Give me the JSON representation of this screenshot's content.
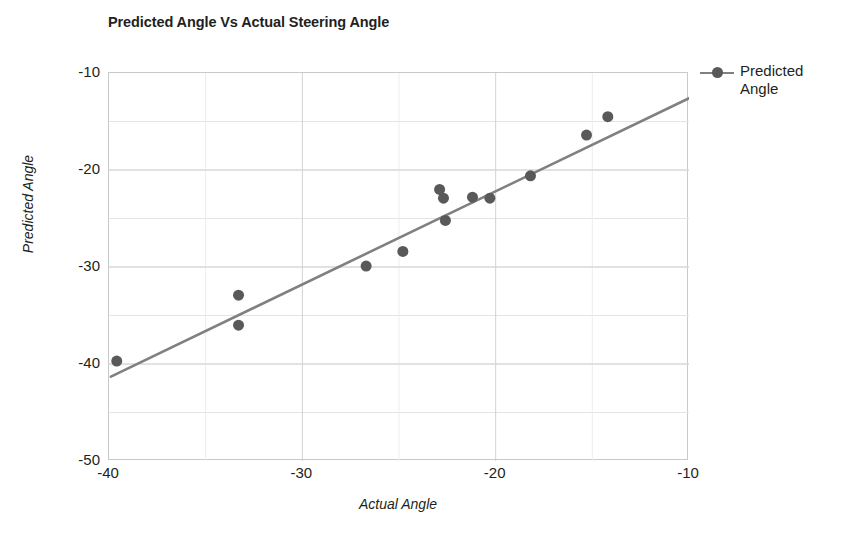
{
  "chart_data": {
    "type": "scatter",
    "title": "Predicted Angle Vs Actual Steering Angle",
    "xlabel": "Actual Angle",
    "ylabel": "Predicted Angle",
    "xlim": [
      -40,
      -10
    ],
    "ylim": [
      -50,
      -10
    ],
    "xticks": [
      "-40",
      "-30",
      "-20",
      "-10"
    ],
    "xtick_values": [
      -40,
      -30,
      -20,
      -10
    ],
    "yticks": [
      "-10",
      "-20",
      "-30",
      "-40",
      "-50"
    ],
    "ytick_values": [
      -10,
      -20,
      -30,
      -40,
      -50
    ],
    "grid": true,
    "grid_minor_step": 5,
    "grid_color": "#d9d9d9",
    "legend_position": "right",
    "series": [
      {
        "name": "Predicted Angle",
        "marker_color": "#595959",
        "line_color": "#808080",
        "marker_size": 11,
        "points": [
          {
            "x": -39.6,
            "y": -39.7
          },
          {
            "x": -33.3,
            "y": -32.9
          },
          {
            "x": -33.3,
            "y": -36.0
          },
          {
            "x": -26.7,
            "y": -29.9
          },
          {
            "x": -24.8,
            "y": -28.4
          },
          {
            "x": -22.9,
            "y": -22.0
          },
          {
            "x": -22.7,
            "y": -22.9
          },
          {
            "x": -22.6,
            "y": -25.2
          },
          {
            "x": -21.2,
            "y": -22.8
          },
          {
            "x": -20.3,
            "y": -22.9
          },
          {
            "x": -18.2,
            "y": -20.6
          },
          {
            "x": -15.3,
            "y": -16.4
          },
          {
            "x": -14.2,
            "y": -14.5
          }
        ],
        "trendline": {
          "x0": -39.9,
          "y0": -41.3,
          "x1": -10.0,
          "y1": -12.6
        }
      }
    ]
  },
  "legend": {
    "entries": [
      {
        "label_line1": "Predicted",
        "label_line2": "Angle"
      }
    ]
  }
}
